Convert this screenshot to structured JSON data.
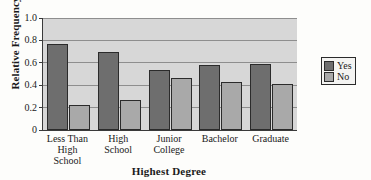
{
  "chart_data": {
    "type": "bar",
    "title": "",
    "xlabel": "Highest Degree",
    "ylabel": "Relative Frequency",
    "categories": [
      "Less Than\nHigh\nSchool",
      "High\nSchool",
      "Junior\nCollege",
      "Bachelor",
      "Graduate"
    ],
    "series": [
      {
        "name": "Yes",
        "values": [
          0.77,
          0.7,
          0.54,
          0.58,
          0.59
        ],
        "color": "#6e6e6e"
      },
      {
        "name": "No",
        "values": [
          0.22,
          0.27,
          0.46,
          0.43,
          0.41
        ],
        "color": "#a9a9a9"
      }
    ],
    "ylim": [
      0,
      1.0
    ],
    "yticks": [
      0,
      0.2,
      0.4,
      0.6,
      0.8,
      1.0
    ],
    "ytick_labels": [
      "0",
      "0.2",
      "0.4",
      "0.6",
      "0.8",
      "1.0"
    ],
    "grid": true,
    "legend_position": "right",
    "plot_background": "#d7d7d7"
  },
  "legend": {
    "entries": [
      {
        "label": "Yes"
      },
      {
        "label": "No"
      }
    ]
  }
}
